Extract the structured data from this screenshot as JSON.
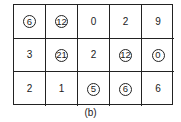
{
  "figure": {
    "caption": "(b)",
    "rows": 3,
    "cols": 5,
    "cells": [
      [
        {
          "value": "6",
          "circled": true
        },
        {
          "value": "12",
          "circled": true
        },
        {
          "value": "0",
          "circled": false
        },
        {
          "value": "2",
          "circled": false
        },
        {
          "value": "9",
          "circled": false
        }
      ],
      [
        {
          "value": "3",
          "circled": false
        },
        {
          "value": "21",
          "circled": true
        },
        {
          "value": "2",
          "circled": false
        },
        {
          "value": "12",
          "circled": true
        },
        {
          "value": "0",
          "circled": true
        }
      ],
      [
        {
          "value": "2",
          "circled": false
        },
        {
          "value": "1",
          "circled": false
        },
        {
          "value": "5",
          "circled": true
        },
        {
          "value": "6",
          "circled": true
        },
        {
          "value": "6",
          "circled": false
        }
      ]
    ]
  }
}
